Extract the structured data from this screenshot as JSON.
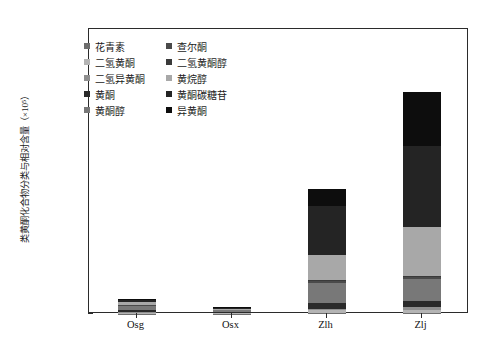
{
  "chart_data": {
    "type": "bar",
    "subtype": "stacked",
    "title": "",
    "xlabel": "",
    "ylabel": "类黄酮化合物分类与相对含量（×10⁵）",
    "categories": [
      "Osg",
      "Osx",
      "Zlh",
      "Zlj"
    ],
    "ylim": [
      0.0,
      12.0
    ],
    "ytick_labels": [
      "0.00",
      "2.00",
      "4.00",
      "6.00",
      "8.00",
      "10.00",
      "12.00"
    ],
    "ytick_values": [
      0.0,
      2.0,
      4.0,
      6.0,
      8.0,
      10.0,
      12.0
    ],
    "grid": false,
    "legend_position": "upper-left-inside",
    "series": [
      {
        "name": "花青素",
        "color": "#6e6e6e",
        "values": [
          0.02,
          0.01,
          0.05,
          0.06
        ]
      },
      {
        "name": "二氢黄酮",
        "color": "#b4b4b4",
        "values": [
          0.03,
          0.02,
          0.1,
          0.12
        ]
      },
      {
        "name": "二氢异黄酮",
        "color": "#8f8f8f",
        "values": [
          0.04,
          0.02,
          0.08,
          0.1
        ]
      },
      {
        "name": "黄酮",
        "color": "#2a2a2a",
        "values": [
          0.08,
          0.04,
          0.22,
          0.28
        ]
      },
      {
        "name": "黄酮醇",
        "color": "#787878",
        "values": [
          0.18,
          0.07,
          0.86,
          0.9
        ]
      },
      {
        "name": "查尔酮",
        "color": "#4a4a4a",
        "values": [
          0.03,
          0.01,
          0.07,
          0.09
        ]
      },
      {
        "name": "二氢黄酮醇",
        "color": "#3a3a3a",
        "values": [
          0.02,
          0.01,
          0.05,
          0.06
        ]
      },
      {
        "name": "黄烷醇",
        "color": "#a8a8a8",
        "values": [
          0.1,
          0.05,
          1.05,
          2.05
        ]
      },
      {
        "name": "黄酮碳糖苷",
        "color": "#242424",
        "values": [
          0.1,
          0.04,
          2.05,
          3.4
        ]
      },
      {
        "name": "异黄酮",
        "color": "#0d0d0d",
        "values": [
          0.05,
          0.03,
          0.73,
          2.29
        ]
      }
    ],
    "totals": [
      0.65,
      0.3,
      5.26,
      9.35
    ]
  },
  "legend": {
    "left_column": [
      {
        "label": "花青素",
        "color": "#6e6e6e"
      },
      {
        "label": "二氢黄酮",
        "color": "#b4b4b4"
      },
      {
        "label": "二氢异黄酮",
        "color": "#8f8f8f"
      },
      {
        "label": "黄酮",
        "color": "#2a2a2a"
      },
      {
        "label": "黄酮醇",
        "color": "#787878"
      }
    ],
    "right_column": [
      {
        "label": "查尔酮",
        "color": "#4a4a4a"
      },
      {
        "label": "二氢黄酮醇",
        "color": "#3a3a3a"
      },
      {
        "label": "黄烷醇",
        "color": "#a8a8a8"
      },
      {
        "label": "黄酮碳糖苷",
        "color": "#242424"
      },
      {
        "label": "异黄酮",
        "color": "#0d0d0d"
      }
    ]
  },
  "axis": {
    "frame_color": "#2b2b2b",
    "tick_color": "#2b2b2b",
    "label_color": "#111111"
  }
}
